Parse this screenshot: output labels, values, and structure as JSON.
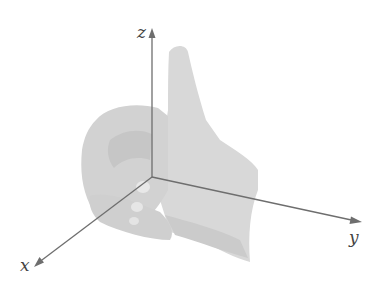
{
  "diagram": {
    "axes": {
      "x": {
        "label": "x"
      },
      "y": {
        "label": "y"
      },
      "z": {
        "label": "z"
      }
    },
    "colors": {
      "axis": "#6e6e6e",
      "hand": "#d6d6d6",
      "hand_shadow": "#c8c8c8",
      "hand_highlight": "#e6e6e6",
      "label": "#444444"
    }
  }
}
